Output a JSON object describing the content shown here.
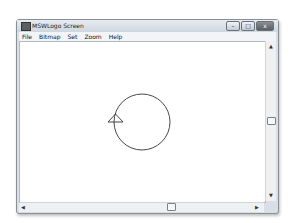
{
  "window": {
    "title": "MSWLogo Screen",
    "controls": {
      "minimize": "–",
      "maximize": "□",
      "close": "x"
    }
  },
  "menu": {
    "items": [
      {
        "label": "File"
      },
      {
        "label": "Bitmap"
      },
      {
        "label": "Set"
      },
      {
        "label": "Zoom"
      },
      {
        "label": "Help"
      }
    ]
  },
  "scrollbars": {
    "up_arrow": "▲",
    "down_arrow": "▼",
    "left_arrow": "◀",
    "right_arrow": "▶"
  },
  "drawing": {
    "shapes": [
      {
        "type": "circle",
        "description": "circle drawn by turtle"
      },
      {
        "type": "turtle",
        "description": "triangle turtle cursor"
      }
    ]
  }
}
